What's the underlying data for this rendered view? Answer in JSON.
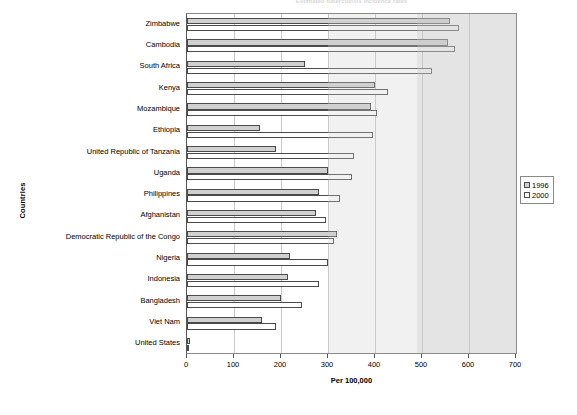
{
  "chart_data": {
    "type": "bar",
    "orientation": "horizontal",
    "title": "Estimated tuberculosis incidence rates",
    "xlabel": "Per 100,000",
    "ylabel": "Countries",
    "xlim": [
      0,
      700
    ],
    "xticks": [
      0,
      100,
      200,
      300,
      400,
      500,
      600,
      700
    ],
    "grid": true,
    "legend_position": "right",
    "categories": [
      "Zimbabwe",
      "Cambodia",
      "South Africa",
      "Kenya",
      "Mozambique",
      "Ethiopia",
      "United Republic of Tanzania",
      "Uganda",
      "Philippines",
      "Afghanistan",
      "Democratic Republic of the Congo",
      "Nigeria",
      "Indonesia",
      "Bangladesh",
      "Viet Nam",
      "United States"
    ],
    "series": [
      {
        "name": "1996",
        "color": "#d0d0d0",
        "values": [
          560,
          555,
          250,
          400,
          392,
          155,
          190,
          300,
          280,
          275,
          320,
          220,
          215,
          200,
          160,
          7
        ]
      },
      {
        "name": "2000",
        "color": "#ffffff",
        "values": [
          578,
          570,
          522,
          428,
          405,
          396,
          356,
          350,
          325,
          295,
          313,
          300,
          280,
          245,
          190,
          5
        ]
      }
    ]
  },
  "legend": {
    "entries": [
      {
        "label": "1996"
      },
      {
        "label": "2000"
      }
    ]
  },
  "axes": {
    "x_title": "Per 100,000",
    "y_title": "Countries",
    "x_tick_labels": [
      "0",
      "100",
      "200",
      "300",
      "400",
      "500",
      "600",
      "700"
    ]
  }
}
